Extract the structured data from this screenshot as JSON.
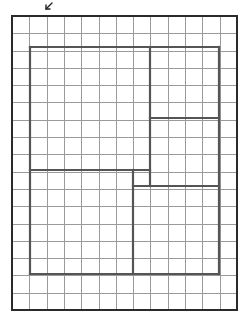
{
  "diagram": {
    "type": "grid-floorplan",
    "grid": {
      "columns": 13,
      "rows": 17,
      "origin_x": 12,
      "origin_y": 16,
      "width": 225,
      "height": 294,
      "line_color": "#9a9a9a"
    },
    "outer_border": {
      "x": 12,
      "y": 16,
      "width": 225,
      "height": 294,
      "color": "#2a2a2a"
    },
    "partitions": [
      {
        "name": "inner-rect-top",
        "x1": 30,
        "y1": 47,
        "x2": 219,
        "y2": 47
      },
      {
        "name": "inner-rect-left",
        "x1": 30,
        "y1": 47,
        "x2": 30,
        "y2": 274
      },
      {
        "name": "inner-rect-right",
        "x1": 219,
        "y1": 47,
        "x2": 219,
        "y2": 274
      },
      {
        "name": "inner-rect-bottom",
        "x1": 30,
        "y1": 274,
        "x2": 219,
        "y2": 274
      },
      {
        "name": "upper-vertical-divider",
        "x1": 150,
        "y1": 47,
        "x2": 150,
        "y2": 186
      },
      {
        "name": "right-room-divider",
        "x1": 150,
        "y1": 118,
        "x2": 219,
        "y2": 118
      },
      {
        "name": "left-horizontal-divider",
        "x1": 30,
        "y1": 170,
        "x2": 150,
        "y2": 170
      },
      {
        "name": "lower-vertical-divider",
        "x1": 133,
        "y1": 170,
        "x2": 133,
        "y2": 274
      },
      {
        "name": "right-horizontal-divider",
        "x1": 133,
        "y1": 186,
        "x2": 219,
        "y2": 186
      }
    ],
    "partition_color": "#555555",
    "regions": [
      {
        "name": "large-upper-left-room"
      },
      {
        "name": "upper-right-room"
      },
      {
        "name": "middle-right-room"
      },
      {
        "name": "lower-left-room"
      },
      {
        "name": "lower-right-room"
      }
    ],
    "annotation": {
      "icon": "arrow-down-left-icon",
      "x": 52,
      "y": 3,
      "tip_x": 46,
      "tip_y": 9
    }
  }
}
